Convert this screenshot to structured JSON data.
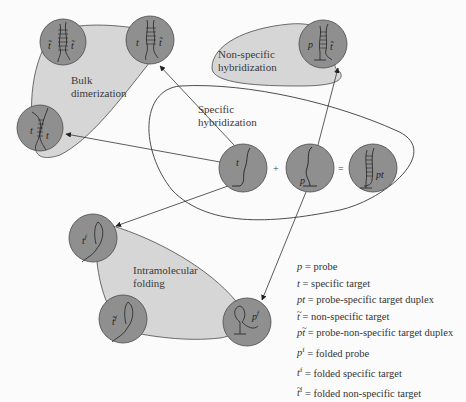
{
  "regions": {
    "bulk_dimerization": "Bulk dimerization",
    "bulk_dimerization_lines": [
      "Bulk",
      "dimerization"
    ],
    "non_specific_hybridization_lines": [
      "Non-specific",
      "hybridization"
    ],
    "specific_hybridization_lines": [
      "Specific",
      "hybridization"
    ],
    "intramolecular_folding_lines": [
      "Intramolecular",
      "folding"
    ]
  },
  "molecules": {
    "t": {
      "label": "t",
      "desc": "specific target"
    },
    "p": {
      "label": "p",
      "desc": "probe"
    },
    "pt": {
      "label": "pt",
      "desc": "probe-specific target duplex"
    },
    "tt_nonspecific": {
      "label_left": "t̃",
      "label_right": "t̃"
    },
    "t_tnonspec": {
      "label_left": "t",
      "label_right": "t̃"
    },
    "tt": {
      "label_left": "t",
      "label_right": "t"
    },
    "p_tnonspec": {
      "label_left": "p",
      "label_right": "t̃"
    },
    "tf": {
      "label": "t",
      "sup": "f"
    },
    "tnf": {
      "label": "t̃",
      "sup": "f"
    },
    "pf": {
      "label": "p",
      "sup": "f"
    }
  },
  "operators": {
    "plus": "+",
    "equals": "="
  },
  "legend": [
    {
      "symbol": "p",
      "tilde": false,
      "sup": "",
      "text": " = probe"
    },
    {
      "symbol": "t",
      "tilde": false,
      "sup": "",
      "text": " = specific target"
    },
    {
      "symbol": "pt",
      "tilde": false,
      "sup": "",
      "text": " = probe-specific target duplex"
    },
    {
      "symbol": "t",
      "tilde": true,
      "sup": "",
      "text": " = non-specific target"
    },
    {
      "symbol": "pt",
      "tilde": true,
      "sup": "",
      "text": " = probe-non-specific target duplex"
    },
    {
      "symbol": "p",
      "tilde": false,
      "sup": "f",
      "text": " = folded probe"
    },
    {
      "symbol": "t",
      "tilde": false,
      "sup": "f",
      "text": " = folded specific target"
    },
    {
      "symbol": "t",
      "tilde": true,
      "sup": "f",
      "text": " = folded non-specific target"
    }
  ],
  "colors": {
    "region_fill": "#d6d6d6",
    "circle_fill": "#8f8f8f",
    "stroke": "#4a4a4a",
    "background": "#fbfbfb"
  }
}
